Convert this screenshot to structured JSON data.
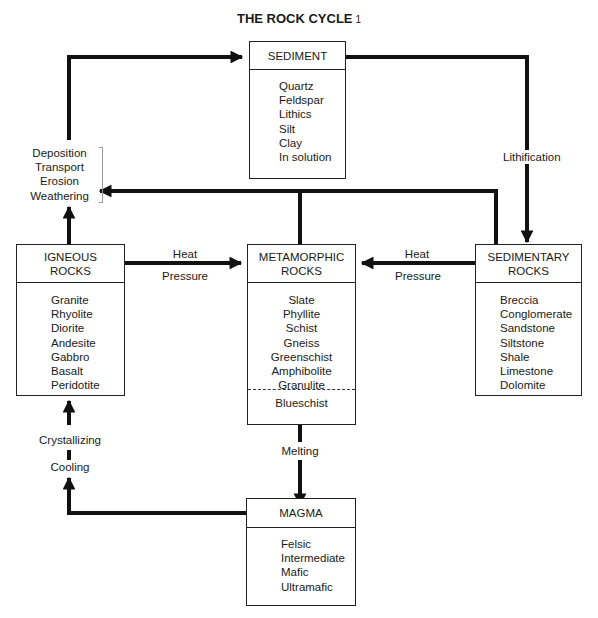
{
  "title": "THE ROCK CYCLE",
  "title_footnote": "1",
  "boxes": {
    "sediment": {
      "header": "SEDIMENT",
      "items": [
        "Quartz",
        "Feldspar",
        "Lithics",
        "Silt",
        "Clay",
        "In solution"
      ]
    },
    "igneous": {
      "header_line1": "IGNEOUS",
      "header_line2": "ROCKS",
      "items": [
        "Granite",
        "Rhyolite",
        "Diorite",
        "Andesite",
        "Gabbro",
        "Basalt",
        "Peridotite"
      ]
    },
    "metamorphic": {
      "header_line1": "METAMORPHIC",
      "header_line2": "ROCKS",
      "items": [
        "Slate",
        "Phyllite",
        "Schist",
        "Gneiss",
        "Greenschist",
        "Amphibolite",
        "Granulite"
      ],
      "extra": "Blueschist"
    },
    "sedimentary": {
      "header_line1": "SEDIMENTARY",
      "header_line2": "ROCKS",
      "items": [
        "Breccia",
        "Conglomerate",
        "Sandstone",
        "Siltstone",
        "Shale",
        "Limestone",
        "Dolomite"
      ]
    },
    "magma": {
      "header": "MAGMA",
      "items": [
        "Felsic",
        "Intermediate",
        "Mafic",
        "Ultramafic"
      ]
    }
  },
  "processes": {
    "surface": [
      "Deposition",
      "Transport",
      "Erosion",
      "Weathering"
    ],
    "lithification": "Lithification",
    "igneous_to_meta": {
      "top": "Heat",
      "bottom": "Pressure"
    },
    "sedimentary_to_meta": {
      "top": "Heat",
      "bottom": "Pressure"
    },
    "melting": "Melting",
    "crystallizing": "Crystallizing",
    "cooling": "Cooling"
  },
  "colors": {
    "line": "#111111",
    "border": "#222222",
    "background": "#ffffff"
  }
}
